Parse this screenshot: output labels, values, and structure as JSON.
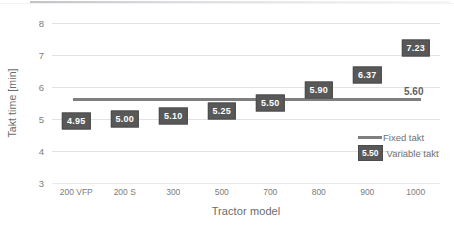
{
  "chart_data": {
    "type": "bar",
    "title": "",
    "xlabel": "Tractor model",
    "ylabel": "Takt time [min]",
    "categories": [
      "200 VFP",
      "200 S",
      "300",
      "500",
      "700",
      "800",
      "900",
      "1000"
    ],
    "ylim": [
      3,
      8
    ],
    "yticks": [
      "3",
      "4",
      "5",
      "6",
      "7",
      "8"
    ],
    "grid": true,
    "legend_position": "inside-right",
    "series": [
      {
        "name": "Variable takt",
        "type": "point-label",
        "values": [
          4.95,
          5.0,
          5.1,
          5.25,
          5.5,
          5.9,
          6.37,
          7.23
        ],
        "labels": [
          "4.95",
          "5.00",
          "5.10",
          "5.25",
          "5.50",
          "5.90",
          "6.37",
          "7.23"
        ],
        "color": "#585858"
      },
      {
        "name": "Fixed takt",
        "type": "line",
        "constant_value": 5.6,
        "label": "5.60",
        "color": "#7f7f7f"
      }
    ],
    "legend": [
      {
        "label": "Fixed takt",
        "swatch": "line",
        "color": "#7f7f7f"
      },
      {
        "label": "Variable takt",
        "swatch": "box",
        "swatch_text": "5.50",
        "color": "#585858"
      }
    ],
    "annotations": [
      {
        "text": "5.60",
        "target": "fixed-takt-line",
        "x_category": "1000"
      }
    ]
  },
  "colors": {
    "series_dark": "#585858",
    "fixed_line": "#7f7f7f",
    "gridline": "#e3e3e5",
    "axis_text": "#7c7c7c",
    "title_text": "#6b6b6b",
    "background": "#ffffff"
  }
}
